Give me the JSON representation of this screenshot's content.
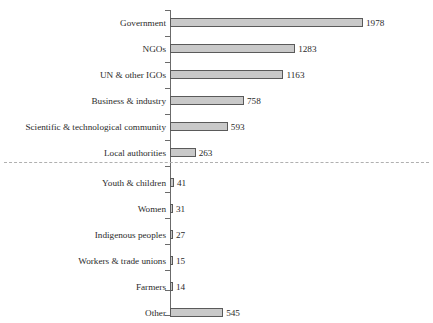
{
  "chart_data": {
    "type": "bar",
    "orientation": "horizontal",
    "title": "",
    "subtitle": "",
    "xlabel": "",
    "ylabel": "",
    "grid": false,
    "legend": null,
    "xlim": [
      0,
      1978
    ],
    "categories": [
      "Government",
      "NGOs",
      "UN & other IGOs",
      "Business & industry",
      "Scientific & technological community",
      "Local authorities",
      "Youth & children",
      "Women",
      "Indigenous peoples",
      "Workers & trade unions",
      "Farmers",
      "Other"
    ],
    "values": [
      1978,
      1283,
      1163,
      758,
      593,
      263,
      41,
      31,
      27,
      15,
      14,
      545
    ],
    "data_labels": [
      "1978",
      "1283",
      "1163",
      "758",
      "593",
      "263",
      "41",
      "31",
      "27",
      "15",
      "14",
      "545"
    ],
    "annotations": [
      {
        "name": "group-divider",
        "type": "horizontal-dashed-line",
        "after_category": "Local authorities",
        "style": "dashed",
        "color": "#b0b0b0"
      }
    ],
    "colors": {
      "bar_fill": "#c9c9c9",
      "bar_border": "#5a5a5a",
      "axis": "#6b6b6b",
      "text": "#2b2b2b",
      "divider": "#b0b0b0",
      "background": "#ffffff"
    }
  }
}
